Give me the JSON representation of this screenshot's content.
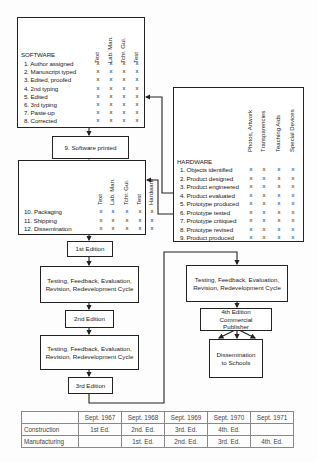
{
  "software": {
    "title": "SOFTWARE",
    "columns": [
      "Text",
      "Lab. Man.",
      "Tchr. Gui.",
      "Test"
    ],
    "items": [
      {
        "label": "1. Author assigned",
        "marks": [
          "x",
          "x",
          "x",
          "x"
        ]
      },
      {
        "label": "2. Manuscript typed",
        "marks": [
          "x",
          "x",
          "x",
          "x"
        ]
      },
      {
        "label": "3. Edited, proofed",
        "marks": [
          "x",
          "x",
          "x",
          "x"
        ]
      },
      {
        "label": "4. 2nd typing",
        "marks": [
          "x",
          "x",
          "x",
          "x"
        ]
      },
      {
        "label": "5. Edited",
        "marks": [
          "x",
          "x",
          "x",
          "x"
        ]
      },
      {
        "label": "6. 3rd typing",
        "marks": [
          "x",
          "x",
          "x",
          "x"
        ]
      },
      {
        "label": "7. Paste-up",
        "marks": [
          "x",
          "x",
          "x",
          "x"
        ]
      },
      {
        "label": "8. Corrected",
        "marks": [
          "x",
          "x",
          "x",
          "x"
        ]
      }
    ]
  },
  "software_printed": "9. Software printed",
  "distribution": {
    "columns": [
      "Text",
      "Lab. Man.",
      "Tchr. Gui.",
      "Test",
      "Hardware"
    ],
    "items": [
      {
        "label": "10. Packaging",
        "marks": [
          "x",
          "x",
          "x",
          "x",
          "x"
        ]
      },
      {
        "label": "11. Shipping",
        "marks": [
          "x",
          "x",
          "x",
          "x",
          "x"
        ]
      },
      {
        "label": "12. Dissemination",
        "marks": [
          "x",
          "x",
          "x",
          "x",
          "x"
        ]
      }
    ]
  },
  "hardware": {
    "title": "HARDWARE",
    "columns": [
      "Photos, Artwork",
      "Transparencies",
      "Teaching Aids",
      "Special Devices"
    ],
    "items": [
      {
        "label": "1. Objects identified",
        "marks": [
          "x",
          "x",
          "x",
          "x"
        ]
      },
      {
        "label": "2. Product designed",
        "marks": [
          "x",
          "x",
          "x",
          "x"
        ]
      },
      {
        "label": "3. Product engineered",
        "marks": [
          "x",
          "x",
          "x",
          "x"
        ]
      },
      {
        "label": "4. Product evaluated",
        "marks": [
          "x",
          "x",
          "x",
          "x"
        ]
      },
      {
        "label": "5. Prototype produced",
        "marks": [
          "x",
          "x",
          "x",
          "x"
        ]
      },
      {
        "label": "6. Prototype tested",
        "marks": [
          "x",
          "x",
          "x",
          "x"
        ]
      },
      {
        "label": "7. Prototype critiqued",
        "marks": [
          "x",
          "x",
          "x",
          "x"
        ]
      },
      {
        "label": "8. Prototype revised",
        "marks": [
          "x",
          "x",
          "x",
          "x"
        ]
      },
      {
        "label": "9. Product produced",
        "marks": [
          "x",
          "x",
          "x",
          "x"
        ]
      }
    ]
  },
  "flow": {
    "edition1": "1st Edition",
    "cycle1": "Testing, Feedback, Evaluation, Revision, Redevelopment Cycle",
    "edition2": "2nd Edition",
    "cycle2": "Testing, Feedback, Evaluation, Revision, Redevelopment Cycle",
    "edition3": "3rd Edition",
    "cycle3": "Testing, Feedback, Evaluation, Revision, Redevelopment Cycle",
    "edition4": "4th Edition Commercial Publisher",
    "dissemination": "Dissemination to Schools"
  },
  "schedule": {
    "headers": [
      "",
      "Sept. 1967",
      "Sept. 1968",
      "Sept. 1969",
      "Sept. 1970",
      "Sept. 1971"
    ],
    "rows": [
      {
        "label": "Construction",
        "cells": [
          "1st Ed.",
          "2nd. Ed.",
          "3rd. Ed.",
          "4th. Ed.",
          ""
        ]
      },
      {
        "label": "Manufacturing",
        "cells": [
          "",
          "1st. Ed.",
          "2nd. Ed.",
          "3rd. Ed.",
          "4th. Ed."
        ]
      }
    ]
  }
}
